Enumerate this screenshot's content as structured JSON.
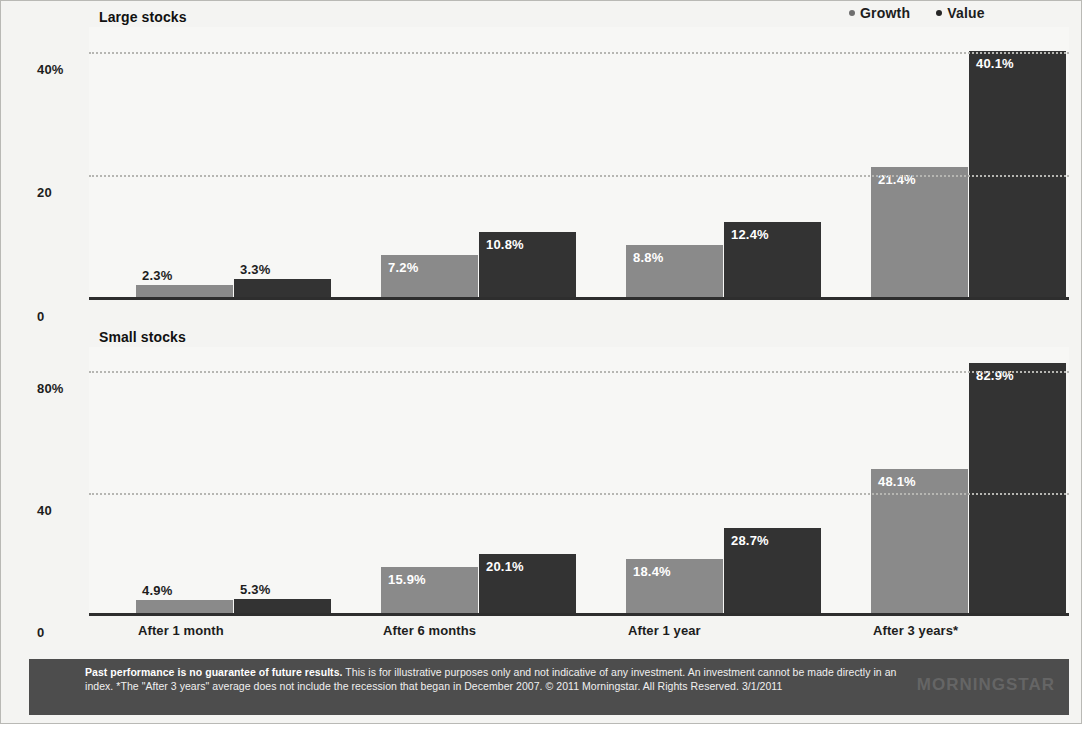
{
  "legend": {
    "items": [
      {
        "label": "Growth",
        "color": "#8a8a8a",
        "key": "growth"
      },
      {
        "label": "Value",
        "color": "#333333",
        "key": "value"
      }
    ]
  },
  "panels": [
    {
      "title": "Large stocks",
      "yticks": [
        "40%",
        "20",
        "0"
      ],
      "ymax": 44.0
    },
    {
      "title": "Small stocks",
      "yticks": [
        "80%",
        "40",
        "0"
      ],
      "ymax": 88.0
    }
  ],
  "xlabels": [
    "After 1 month",
    "After 6 months",
    "After 1 year",
    "After 3 years*"
  ],
  "footer": {
    "line1_bold": "Past performance is no guarantee of future results.",
    "line1_rest": " This is for illustrative purposes only and not indicative of any investment. An investment cannot",
    "line2": "be made directly in an index. *The \"After 3 years\" average does not include the recession that began in December 2007. © 2011 Morningstar. All Rights",
    "line3": "Reserved. 3/1/2011",
    "logo": "MORNINGSTAR"
  },
  "chart_data": [
    {
      "type": "bar",
      "title": "Large stocks",
      "categories": [
        "After 1 month",
        "After 6 months",
        "After 1 year",
        "After 3 years*"
      ],
      "series": [
        {
          "name": "Growth",
          "values": [
            2.3,
            7.2,
            8.8,
            21.4
          ],
          "labels": [
            "2.3%",
            "7.2%",
            "8.8%",
            "21.4%"
          ],
          "color": "#8a8a8a"
        },
        {
          "name": "Value",
          "values": [
            3.3,
            10.8,
            12.4,
            40.1
          ],
          "labels": [
            "3.3%",
            "10.8%",
            "12.4%",
            "40.1%"
          ],
          "color": "#333333"
        }
      ],
      "xlabel": "",
      "ylabel": "",
      "ylim": [
        0,
        44
      ],
      "yticks": [
        0,
        20,
        40
      ],
      "ytick_labels": [
        "0",
        "20",
        "40%"
      ],
      "grid": true,
      "legend_position": "top-right"
    },
    {
      "type": "bar",
      "title": "Small stocks",
      "categories": [
        "After 1 month",
        "After 6 months",
        "After 1 year",
        "After 3 years*"
      ],
      "series": [
        {
          "name": "Growth",
          "values": [
            4.9,
            15.9,
            18.4,
            48.1
          ],
          "labels": [
            "4.9%",
            "15.9%",
            "18.4%",
            "48.1%"
          ],
          "color": "#8a8a8a"
        },
        {
          "name": "Value",
          "values": [
            5.3,
            20.1,
            28.7,
            82.9
          ],
          "labels": [
            "5.3%",
            "20.1%",
            "28.7%",
            "82.9%"
          ],
          "color": "#333333"
        }
      ],
      "xlabel": "",
      "ylabel": "",
      "ylim": [
        0,
        88
      ],
      "yticks": [
        0,
        40,
        80
      ],
      "ytick_labels": [
        "0",
        "40",
        "80%"
      ],
      "grid": true,
      "legend_position": "top-right"
    }
  ]
}
